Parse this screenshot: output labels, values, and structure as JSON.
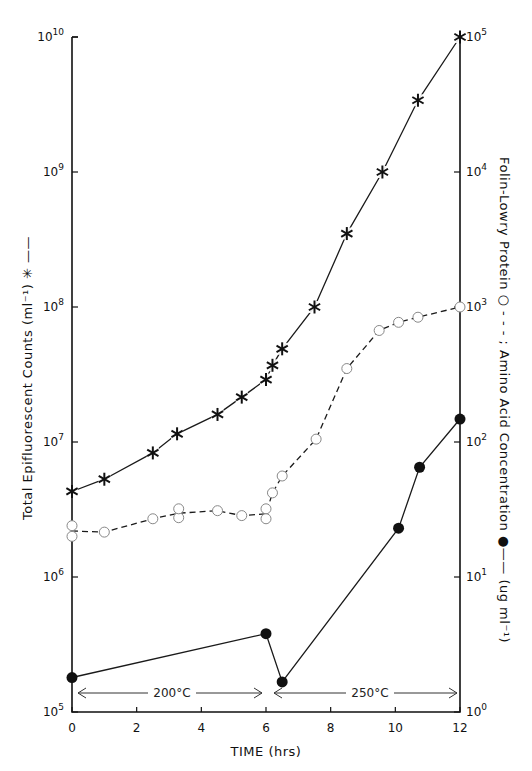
{
  "chart_data": {
    "type": "line",
    "title": "",
    "xlabel": "TIME (hrs)",
    "ylabel_left": "Total Epifluorescent Counts (ml⁻¹) ✳ ——",
    "ylabel_right": "Folin-Lowry Protein ○ - - - ; Amino Acid Concentration ● —— (ug ml⁻¹)",
    "x_ticks": [
      0,
      2,
      4,
      6,
      8,
      10,
      12
    ],
    "xlim": [
      0,
      12
    ],
    "y_left_scale": "log",
    "y_left_lim": [
      100000,
      10000000000
    ],
    "y_left_ticks": [
      "10^5",
      "10^6",
      "10^7",
      "10^8",
      "10^9",
      "10^10"
    ],
    "y_right_scale": "log",
    "y_right_lim": [
      1,
      100000
    ],
    "y_right_ticks": [
      "10^0",
      "10^1",
      "10^2",
      "10^3",
      "10^4",
      "10^5"
    ],
    "grid": false,
    "legend_position": "axis labels",
    "annotations": [
      {
        "text": "200°C",
        "x_range": [
          0,
          6
        ]
      },
      {
        "text": "250°C",
        "x_range": [
          6.2,
          12
        ]
      }
    ],
    "series": [
      {
        "name": "Total Epifluorescent Counts (ml-1)",
        "axis": "left",
        "marker": "asterisk",
        "line": "solid",
        "x": [
          0,
          1,
          2.5,
          3.25,
          4.5,
          5.25,
          6.0,
          6.2,
          6.5,
          7.5,
          8.5,
          9.6,
          10.7,
          12
        ],
        "y": [
          4300000,
          5300000,
          8300000,
          11500000,
          16000000,
          21500000,
          29000000,
          37000000,
          49000000,
          100000000,
          350000000,
          1000000000,
          3400000000,
          10000000000
        ]
      },
      {
        "name": "Folin-Lowry Protein (ug ml-1)",
        "axis": "right",
        "marker": "open-circle",
        "line": "dashed",
        "x": [
          0,
          0,
          1,
          2.5,
          3.3,
          3.3,
          4.5,
          5.25,
          6.0,
          6.0,
          6.2,
          6.5,
          7.55,
          8.5,
          9.5,
          10.1,
          10.7,
          12
        ],
        "y": [
          24,
          20,
          21.5,
          27,
          27.5,
          32,
          31,
          28.5,
          32,
          27,
          42,
          56,
          105,
          350,
          670,
          770,
          840,
          1000
        ]
      },
      {
        "name": "Amino Acid Concentration (ug ml-1)",
        "axis": "right",
        "marker": "filled-circle",
        "line": "solid",
        "x": [
          0,
          6.0,
          6.5,
          10.1,
          10.75,
          12
        ],
        "y": [
          1.8,
          3.8,
          1.67,
          23,
          65,
          148
        ]
      }
    ]
  },
  "labels": {
    "xlabel": "TIME (hrs)",
    "ylabel_left": "Total  Epifluorescent  Counts  (ml⁻¹)  ✳ ——",
    "ylabel_right": "Folin-Lowry  Protein  ○ - - -  ;  Amino  Acid  Concentration  ●——  (ug ml⁻¹)",
    "temp_left": "200°C",
    "temp_right": "250°C"
  }
}
